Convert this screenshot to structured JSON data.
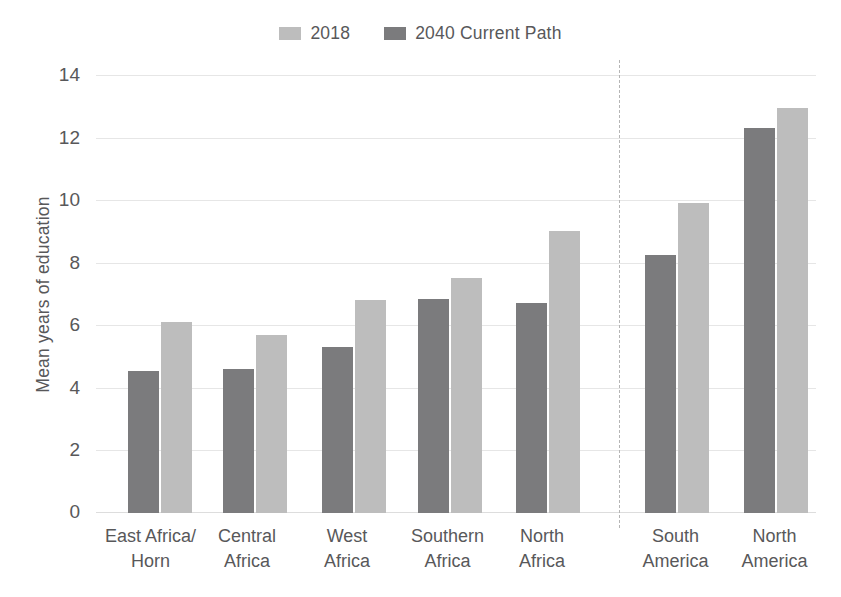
{
  "legend": {
    "items": [
      {
        "label": "2018",
        "color": "#bdbdbd",
        "swatch_name": "legend-swatch-2018"
      },
      {
        "label": "2040 Current Path",
        "color": "#7b7b7d",
        "swatch_name": "legend-swatch-2040"
      }
    ]
  },
  "axis": {
    "ylabel": "Mean years of education",
    "yticks": [
      "0",
      "2",
      "4",
      "6",
      "8",
      "10",
      "12",
      "14"
    ]
  },
  "chart_data": {
    "type": "bar",
    "title": "",
    "subtitle": "",
    "xlabel": "",
    "ylabel": "Mean years of education",
    "ylim": [
      0,
      14
    ],
    "ytick_values": [
      0,
      2,
      4,
      6,
      8,
      10,
      12,
      14
    ],
    "grid": true,
    "legend_position": "top-center",
    "bar_order_in_group": [
      "2040 Current Path",
      "2018"
    ],
    "categories": [
      "East Africa/\nHorn",
      "Central\nAfrica",
      "West\nAfrica",
      "Southern\nAfrica",
      "North\nAfrica",
      "South\nAmerica",
      "North\nAmerica"
    ],
    "series": [
      {
        "name": "2018",
        "color": "#bdbdbd",
        "values": [
          6.1,
          5.7,
          6.8,
          7.5,
          9.0,
          9.9,
          12.95
        ]
      },
      {
        "name": "2040 Current Path",
        "color": "#7b7b7d",
        "values": [
          4.55,
          4.6,
          5.3,
          6.85,
          6.7,
          8.25,
          12.3
        ]
      }
    ],
    "annotations": [
      {
        "type": "vertical-divider",
        "style": "dashed",
        "color": "#b5b5b5",
        "after_category": "North\nAfrica",
        "note": "separates African regions from the Americas"
      }
    ]
  }
}
